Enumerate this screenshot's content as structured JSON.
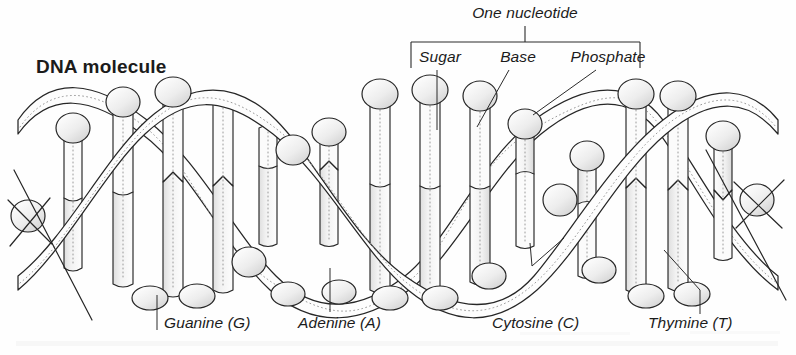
{
  "figure": {
    "title": "DNA molecule",
    "width": 796,
    "height": 355,
    "background_color": "#fefefe",
    "ink_color": "#262626",
    "shade_color": "#e8e8e8"
  },
  "callouts": {
    "nucleotide": {
      "label": "One nucleotide",
      "x": 525,
      "y": 18
    },
    "parts": [
      {
        "key": "sugar",
        "label": "Sugar",
        "x": 440,
        "y": 59
      },
      {
        "key": "base",
        "label": "Base",
        "x": 518,
        "y": 59
      },
      {
        "key": "phosphate",
        "label": "Phosphate",
        "x": 608,
        "y": 59
      }
    ]
  },
  "bases": [
    {
      "key": "guanine",
      "label": "Guanine (G)",
      "x": 164,
      "y": 325
    },
    {
      "key": "adenine",
      "label": "Adenine (A)",
      "x": 298,
      "y": 325
    },
    {
      "key": "cytosine",
      "label": "Cytosine (C)",
      "x": 492,
      "y": 325
    },
    {
      "key": "thymine",
      "label": "Thymine (T)",
      "x": 648,
      "y": 325
    }
  ],
  "helix": {
    "description": "DNA double helix drawn as two sinusoidal backbone ribbons with spherical phosphate groups and paired cylindrical base rungs",
    "left": 18,
    "right": 778,
    "top": 88,
    "bottom": 308,
    "center_y": 198,
    "amplitude": 104,
    "period": 258,
    "turns": 3,
    "rungs_per_turn": 5,
    "spheres_per_turn": 4
  }
}
